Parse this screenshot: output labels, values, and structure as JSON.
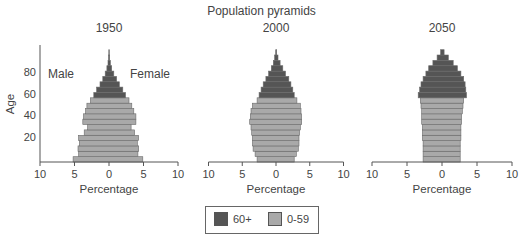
{
  "title": "Population pyramids",
  "colors": {
    "old": "#555555",
    "young": "#a9a9a9",
    "outline": "#6a6a6a",
    "axis": "#555555"
  },
  "legend": {
    "items": [
      {
        "label": "60+",
        "color": "#555555"
      },
      {
        "label": "0-59",
        "color": "#a9a9a9"
      }
    ]
  },
  "labels": {
    "male": "Male",
    "female": "Female",
    "ylabel": "Age",
    "xlabel": "Percentage"
  },
  "chart_data": [
    {
      "type": "bar",
      "title": "1950",
      "xlabel": "Percentage",
      "ylabel": "Age",
      "xlim": [
        -10,
        10
      ],
      "xticks": [
        10,
        5,
        0,
        5,
        10
      ],
      "yticks": [
        20,
        40,
        60,
        80
      ],
      "age_groups": [
        "0-4",
        "5-9",
        "10-14",
        "15-19",
        "20-24",
        "25-29",
        "30-34",
        "35-39",
        "40-44",
        "45-49",
        "50-54",
        "55-59",
        "60-64",
        "65-69",
        "70-74",
        "75-79",
        "80-84",
        "85-89",
        "90-94",
        "95-99",
        "100+"
      ],
      "series": [
        {
          "name": "Male",
          "values": [
            5.2,
            4.4,
            4.5,
            4.3,
            4.4,
            3.6,
            3.1,
            3.8,
            3.7,
            3.4,
            3.2,
            2.7,
            2.2,
            1.8,
            1.3,
            0.9,
            0.55,
            0.3,
            0.15,
            0.07,
            0.03
          ]
        },
        {
          "name": "Female",
          "values": [
            4.9,
            4.2,
            4.3,
            4.1,
            4.3,
            3.7,
            3.2,
            3.9,
            3.9,
            3.6,
            3.3,
            2.9,
            2.4,
            2.0,
            1.5,
            1.1,
            0.7,
            0.4,
            0.2,
            0.1,
            0.04
          ]
        }
      ]
    },
    {
      "type": "bar",
      "title": "2000",
      "xlabel": "Percentage",
      "xlim": [
        -10,
        10
      ],
      "xticks": [
        10,
        5,
        0,
        5,
        10
      ],
      "age_groups": [
        "0-4",
        "5-9",
        "10-14",
        "15-19",
        "20-24",
        "25-29",
        "30-34",
        "35-39",
        "40-44",
        "45-49",
        "50-54",
        "55-59",
        "60-64",
        "65-69",
        "70-74",
        "75-79",
        "80-84",
        "85-89",
        "90-94",
        "95-99",
        "100+"
      ],
      "series": [
        {
          "name": "Male",
          "values": [
            2.8,
            3.1,
            3.4,
            3.5,
            3.5,
            3.6,
            3.7,
            3.9,
            3.8,
            3.7,
            3.5,
            2.8,
            2.5,
            2.2,
            1.9,
            1.5,
            1.1,
            0.7,
            0.4,
            0.2,
            0.05
          ]
        },
        {
          "name": "Female",
          "values": [
            2.7,
            3.0,
            3.3,
            3.4,
            3.4,
            3.5,
            3.6,
            3.8,
            3.8,
            3.7,
            3.6,
            3.1,
            2.7,
            2.5,
            2.2,
            1.9,
            1.4,
            1.0,
            0.6,
            0.3,
            0.1
          ]
        }
      ]
    },
    {
      "type": "bar",
      "title": "2050",
      "xlabel": "Percentage",
      "xlim": [
        -10,
        10
      ],
      "xticks": [
        10,
        5,
        0,
        5,
        10
      ],
      "age_groups": [
        "0-4",
        "5-9",
        "10-14",
        "15-19",
        "20-24",
        "25-29",
        "30-34",
        "35-39",
        "40-44",
        "45-49",
        "50-54",
        "55-59",
        "60-64",
        "65-69",
        "70-74",
        "75-79",
        "80-84",
        "85-89",
        "90-94",
        "95-99",
        "100+"
      ],
      "series": [
        {
          "name": "Male",
          "values": [
            2.7,
            2.7,
            2.7,
            2.7,
            2.8,
            2.8,
            2.8,
            2.9,
            2.9,
            2.9,
            3.0,
            3.1,
            3.4,
            3.2,
            3.0,
            2.7,
            2.3,
            1.9,
            1.3,
            0.7,
            0.2
          ]
        },
        {
          "name": "Female",
          "values": [
            2.6,
            2.6,
            2.6,
            2.6,
            2.7,
            2.7,
            2.7,
            2.8,
            2.8,
            2.9,
            3.0,
            3.1,
            3.5,
            3.4,
            3.3,
            3.1,
            2.7,
            2.2,
            1.6,
            0.9,
            0.3
          ]
        }
      ]
    }
  ]
}
